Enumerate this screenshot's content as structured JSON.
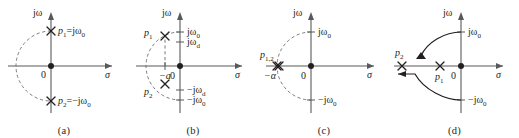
{
  "figure": {
    "type": "pole-zero-plots",
    "background_color": "#ffffff",
    "axis_color": "#58595b",
    "mark_color": "#231f20",
    "dash_color": "#6d6e71"
  },
  "panels": [
    {
      "id": "a",
      "caption": "(a)",
      "axes": {
        "imag_label": "jω",
        "real_label": "σ",
        "origin_label": "0"
      },
      "poles": [
        {
          "name": "p1",
          "label_base": "p",
          "label_sub": "1",
          "label_value": "=jω",
          "label_value_sub": "0",
          "marker": "x",
          "sigma": 0,
          "omega": 1.0
        },
        {
          "name": "p2",
          "label_base": "p",
          "label_sub": "2",
          "label_value": "=−jω",
          "label_value_sub": "0",
          "marker": "x",
          "sigma": 0,
          "omega": -1.0
        }
      ],
      "dashed_arc": "semicircle-left",
      "damping": "undamped"
    },
    {
      "id": "b",
      "caption": "(b)",
      "axes": {
        "imag_label": "jω",
        "real_label": "σ",
        "origin_label": "0"
      },
      "tick_labels": [
        {
          "name": "jw0-tick",
          "base": "jω",
          "sub": "0",
          "side": "upper"
        },
        {
          "name": "jwd-tick",
          "base": "jω",
          "sub": "d",
          "side": "upper"
        },
        {
          "name": "neg-jwd-tick",
          "base": "−jω",
          "sub": "d",
          "side": "lower"
        },
        {
          "name": "neg-jw0-tick",
          "base": "−jω",
          "sub": "0",
          "side": "lower"
        }
      ],
      "sigma_tick": {
        "name": "neg-a-tick",
        "label": "−a"
      },
      "poles": [
        {
          "name": "p1",
          "label_base": "p",
          "label_sub": "1",
          "marker": "x",
          "sigma": -0.45,
          "omega": 0.89
        },
        {
          "name": "p2",
          "label_base": "p",
          "label_sub": "2",
          "marker": "x",
          "sigma": -0.45,
          "omega": -0.89
        }
      ],
      "dashed_arc": "semicircle-left",
      "damping": "underdamped"
    },
    {
      "id": "c",
      "caption": "(c)",
      "axes": {
        "imag_label": "jω",
        "real_label": "σ",
        "origin_label": "0"
      },
      "tick_labels": [
        {
          "name": "jw0-tick",
          "base": "jω",
          "sub": "0",
          "side": "upper"
        },
        {
          "name": "neg-jw0-tick",
          "base": "−jω",
          "sub": "0",
          "side": "lower"
        }
      ],
      "sigma_tick": {
        "name": "neg-alpha-tick",
        "label": "−α"
      },
      "poles": [
        {
          "name": "p12",
          "label_base": "p",
          "label_sub": "1,2",
          "marker": "double-x",
          "sigma": -1.0,
          "omega": 0
        }
      ],
      "dashed_arc": "semicircle-left",
      "damping": "critically-damped"
    },
    {
      "id": "d",
      "caption": "(d)",
      "axes": {
        "imag_label": "jω",
        "real_label": "σ",
        "origin_label": "0"
      },
      "tick_labels": [
        {
          "name": "jw0-tick",
          "base": "jω",
          "sub": "0",
          "side": "upper"
        },
        {
          "name": "neg-jw0-tick",
          "base": "−jω",
          "sub": "0",
          "side": "lower"
        }
      ],
      "poles": [
        {
          "name": "p2",
          "label_base": "p",
          "label_sub": "2",
          "marker": "x",
          "sigma": -1.55,
          "omega": 0
        },
        {
          "name": "p1",
          "label_base": "p",
          "label_sub": "1",
          "marker": "x",
          "sigma": -0.52,
          "omega": 0
        }
      ],
      "loci": [
        {
          "name": "upper-locus-arrow",
          "from": "jω",
          "to": "real-axis",
          "direction": "left"
        },
        {
          "name": "lower-locus-arrow",
          "from": "−jω",
          "to": "real-axis",
          "direction": "left"
        }
      ],
      "damping": "overdamped"
    }
  ]
}
